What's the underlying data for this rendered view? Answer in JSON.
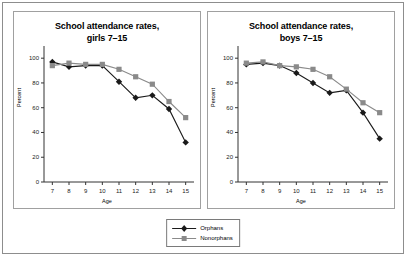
{
  "figure": {
    "legend": {
      "position": "bottom-center",
      "entries": [
        {
          "label": "Orphans",
          "marker": "diamond",
          "color": "#1a1a1a"
        },
        {
          "label": "Nonorphans",
          "marker": "square",
          "color": "#8a8a8a"
        }
      ]
    }
  },
  "chart_data": [
    {
      "type": "line",
      "title": "School attendance rates,",
      "subtitle": "girls 7–15",
      "xlabel": "Age",
      "ylabel": "Percent",
      "x": [
        7,
        8,
        9,
        10,
        11,
        12,
        13,
        14,
        15
      ],
      "xticklabels": [
        "7",
        "8",
        "9",
        "10",
        "11",
        "12",
        "13",
        "14",
        "15"
      ],
      "yticks": [
        0,
        20,
        40,
        60,
        80,
        100
      ],
      "ylim": [
        0,
        105
      ],
      "xlim": [
        6.5,
        15.5
      ],
      "grid": false,
      "series": [
        {
          "name": "Orphans",
          "marker": "diamond",
          "color": "#1a1a1a",
          "values": [
            97,
            93,
            94,
            94,
            81,
            68,
            70,
            59,
            32
          ]
        },
        {
          "name": "Nonorphans",
          "marker": "square",
          "color": "#8a8a8a",
          "values": [
            94,
            96,
            95,
            95,
            91,
            85,
            79,
            65,
            52
          ]
        }
      ]
    },
    {
      "type": "line",
      "title": "School attendance rates,",
      "subtitle": "boys 7–15",
      "xlabel": "Age",
      "ylabel": "Percent",
      "x": [
        7,
        8,
        9,
        10,
        11,
        12,
        13,
        14,
        15
      ],
      "xticklabels": [
        "7",
        "8",
        "9",
        "10",
        "11",
        "12",
        "13",
        "14",
        "15"
      ],
      "yticks": [
        0,
        20,
        40,
        60,
        80,
        100
      ],
      "ylim": [
        0,
        105
      ],
      "xlim": [
        6.5,
        15.5
      ],
      "grid": false,
      "series": [
        {
          "name": "Orphans",
          "marker": "diamond",
          "color": "#1a1a1a",
          "values": [
            95,
            96,
            94,
            88,
            80,
            72,
            74,
            56,
            35
          ]
        },
        {
          "name": "Nonorphans",
          "marker": "square",
          "color": "#8a8a8a",
          "values": [
            96,
            97,
            94,
            93,
            91,
            85,
            75,
            64,
            56
          ]
        }
      ]
    }
  ]
}
